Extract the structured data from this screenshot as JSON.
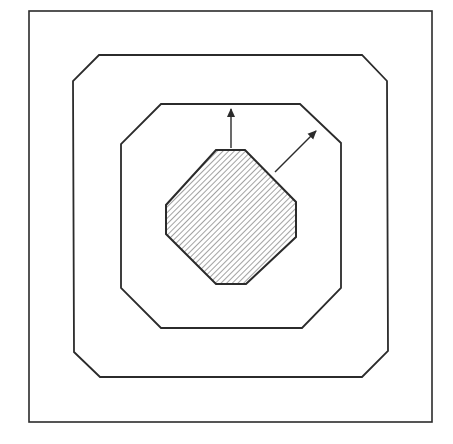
{
  "diagram": {
    "stroke_color": "#2b2b2b",
    "background_color": "#ffffff",
    "hatch_color": "#555555",
    "outer_box": {
      "x1": 29,
      "y1": 11,
      "x2": 432,
      "y2": 422
    },
    "middle_octagon": {
      "points": "99,55 362,55 387,81 388,351 362,377 100,377 74,352 73,81"
    },
    "inner_octagon": {
      "points": "161,104 300,104 341,143 341,288 302,328 161,328 121,288 121,144"
    },
    "core_octagon": {
      "points": "216,150 245,150 296,202 296,237 246,284 216,284 166,234 166,205",
      "fill": "hatched"
    },
    "arrows": [
      {
        "name": "vertical-growth-arrow",
        "x1": 231,
        "y1": 148,
        "x2": 231,
        "y2": 107
      },
      {
        "name": "diagonal-growth-arrow",
        "x1": 275,
        "y1": 172,
        "x2": 318,
        "y2": 129
      }
    ]
  }
}
